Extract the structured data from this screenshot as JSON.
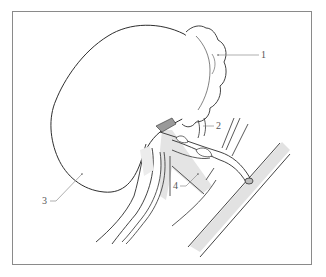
{
  "figure": {
    "type": "anatomical-diagram",
    "colors": {
      "outline": "#2e2e2e",
      "leader_line": "#8c8c8c",
      "shading": "#e2e2e2",
      "frame": "#8a8a8a",
      "label_text": "#555555"
    },
    "labels": [
      {
        "id": "1",
        "text": "1",
        "target": "adrenal gland"
      },
      {
        "id": "2",
        "text": "2",
        "target": "renal vessel branch"
      },
      {
        "id": "3",
        "text": "3",
        "target": "kidney"
      },
      {
        "id": "4",
        "text": "4",
        "target": "renal vein"
      }
    ]
  }
}
